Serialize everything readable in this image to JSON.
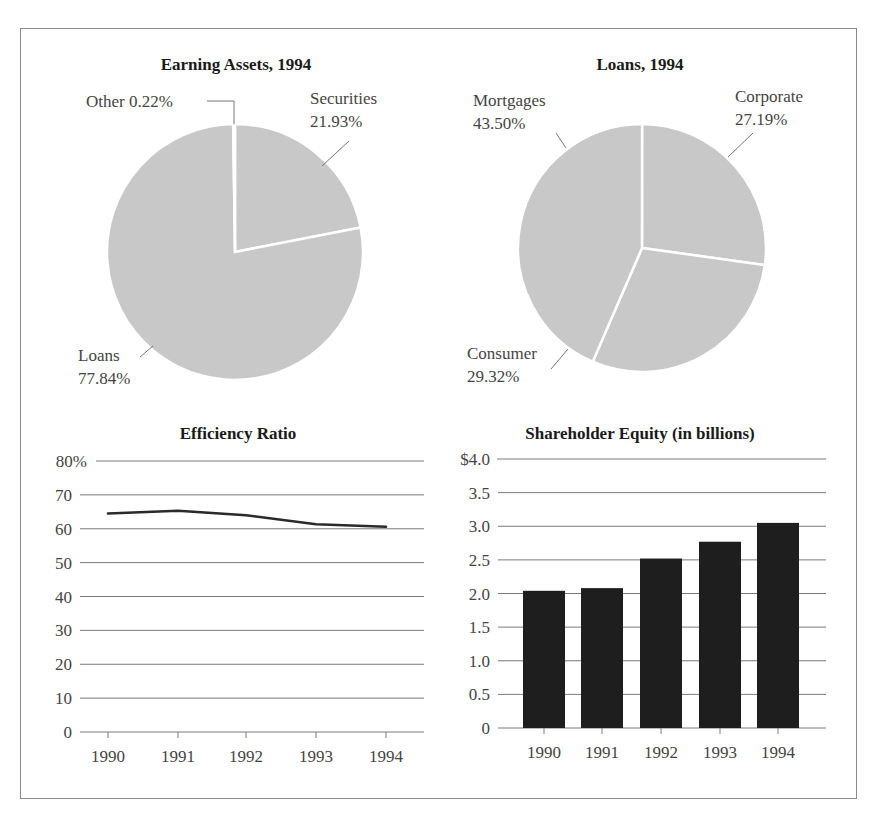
{
  "chart_data": [
    {
      "type": "pie",
      "title": "Earning Assets, 1994",
      "slices": [
        {
          "label": "Securities",
          "value": 21.93,
          "display": "21.93%"
        },
        {
          "label": "Loans",
          "value": 77.84,
          "display": "77.84%"
        },
        {
          "label": "Other",
          "value": 0.22,
          "display": "0.22%"
        }
      ],
      "fill_color": "#c8c8c8",
      "separator_color": "#ffffff"
    },
    {
      "type": "pie",
      "title": "Loans, 1994",
      "slices": [
        {
          "label": "Corporate",
          "value": 27.19,
          "display": "27.19%"
        },
        {
          "label": "Consumer",
          "value": 29.32,
          "display": "29.32%"
        },
        {
          "label": "Mortgages",
          "value": 43.5,
          "display": "43.50%"
        }
      ],
      "fill_color": "#c8c8c8",
      "separator_color": "#ffffff"
    },
    {
      "type": "line",
      "title": "Efficiency Ratio",
      "categories": [
        "1990",
        "1991",
        "1992",
        "1993",
        "1994"
      ],
      "series": [
        {
          "name": "Efficiency Ratio",
          "values": [
            64.5,
            65.3,
            64.0,
            61.3,
            60.6
          ]
        }
      ],
      "ylim": [
        0,
        80
      ],
      "yticks": [
        "0",
        "10",
        "20",
        "30",
        "40",
        "50",
        "60",
        "70",
        "80%"
      ],
      "xlabel": "",
      "ylabel": "",
      "grid": true,
      "line_color": "#2a2a2a"
    },
    {
      "type": "bar",
      "title": "Shareholder Equity (in billions)",
      "categories": [
        "1990",
        "1991",
        "1992",
        "1993",
        "1994"
      ],
      "values": [
        2.04,
        2.08,
        2.52,
        2.77,
        3.05
      ],
      "ylim": [
        0,
        4.0
      ],
      "yticks": [
        "0",
        "0.5",
        "1.0",
        "1.5",
        "2.0",
        "2.5",
        "3.0",
        "3.5",
        "$4.0"
      ],
      "xlabel": "",
      "ylabel": "",
      "grid": true,
      "bar_color": "#1e1e1e"
    }
  ]
}
